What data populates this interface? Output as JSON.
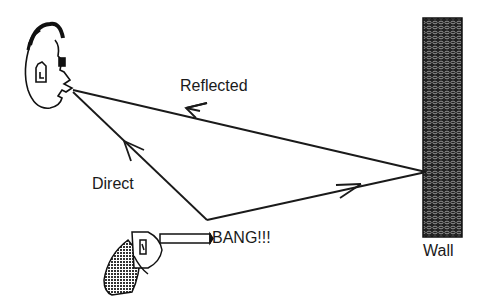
{
  "labels": {
    "reflected": "Reflected",
    "direct": "Direct",
    "bang": "BANG!!!",
    "wall": "Wall"
  },
  "elements": {
    "listener": "face-icon",
    "source": "gun-icon",
    "reflector": "wall"
  },
  "colors": {
    "ink": "#1a1a1a",
    "wall_fill": "#2a2a2a",
    "background": "#ffffff"
  }
}
